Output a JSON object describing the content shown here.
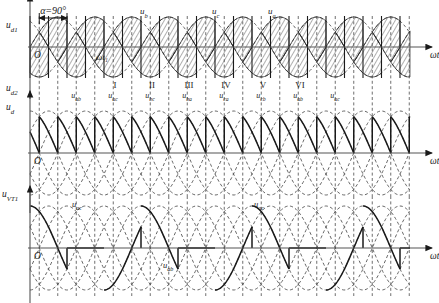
{
  "figure": {
    "title_annotation": "α=90°",
    "background": "#ffffff",
    "ink": "#1a1a1a",
    "dash_color": "#4a4a4a",
    "axis_color": "#555555",
    "width": 439,
    "height": 303
  },
  "axes": [
    {
      "id": "upper",
      "y_label_top": "uₑ₁",
      "y_label_top_plain": "ud1",
      "y_label_bottom": "ud2",
      "origin_label": "O",
      "x_label": "ωt",
      "marker_label": "ωt₁"
    },
    {
      "id": "middle",
      "y_label": "ud",
      "origin_label": "O",
      "x_label": "ωt"
    },
    {
      "id": "lower",
      "y_label": "uVT1",
      "origin_label": "O",
      "x_label": "ωt"
    }
  ],
  "phase_labels": [
    {
      "text": "u",
      "sub": "b",
      "x": 140,
      "y": 14
    },
    {
      "text": "u",
      "sub": "c",
      "x": 212,
      "y": 14
    },
    {
      "text": "u",
      "sub": "a",
      "x": 268,
      "y": 14
    }
  ],
  "interval_labels": [
    {
      "roman": "I",
      "line": "u",
      "sub": "ac",
      "cx": 115
    },
    {
      "roman": "II",
      "line": "u",
      "sub": "bc",
      "cx": 152
    },
    {
      "roman": "III",
      "line": "u",
      "sub": "ba",
      "cx": 189
    },
    {
      "roman": "IV",
      "line": "u",
      "sub": "ca",
      "cx": 226
    },
    {
      "roman": "V",
      "line": "u",
      "sub": "cb",
      "cx": 263
    },
    {
      "roman": "VI",
      "line": "u",
      "sub": "ab",
      "cx": 300
    },
    {
      "roman": "",
      "line": "u",
      "sub": "ac",
      "cx": 337
    }
  ],
  "line_voltage_labels_middle": [
    {
      "text": "u",
      "sub": "ab",
      "x": 76,
      "y": 98
    },
    {
      "text": "u",
      "sub": "ac",
      "x": 113,
      "y": 98
    },
    {
      "text": "u",
      "sub": "bc",
      "x": 150,
      "y": 98
    },
    {
      "text": "u",
      "sub": "ba",
      "x": 187,
      "y": 98
    },
    {
      "text": "u",
      "sub": "ca",
      "x": 224,
      "y": 98
    },
    {
      "text": "u",
      "sub": "cb",
      "x": 261,
      "y": 98
    },
    {
      "text": "u",
      "sub": "ab",
      "x": 298,
      "y": 98
    },
    {
      "text": "u",
      "sub": "ac",
      "x": 335,
      "y": 98
    }
  ],
  "thyristor_labels": [
    {
      "text": "u",
      "sub": "ac",
      "x": 72,
      "y": 207
    },
    {
      "text": "u",
      "sub": "ab",
      "x": 163,
      "y": 268
    },
    {
      "text": "u",
      "sub": "ac",
      "x": 254,
      "y": 207
    }
  ],
  "chart_data": {
    "type": "line",
    "xlabel": "ωt",
    "grid": false,
    "legend": "none",
    "firing_angle_deg": 90,
    "period_px": 111,
    "plot_left": 30,
    "plot_right": 410,
    "panels": [
      {
        "name": "upper",
        "ylabel_top": "ud1",
        "ylabel_bottom": "ud2",
        "baseline_y": 47,
        "amplitude": 30,
        "series": [
          {
            "name": "ua",
            "phase_deg": 0,
            "style": "dashed"
          },
          {
            "name": "ub",
            "phase_deg": -120,
            "style": "dashed"
          },
          {
            "name": "uc",
            "phase_deg": -240,
            "style": "dashed"
          }
        ],
        "hatched_regions": true
      },
      {
        "name": "middle",
        "ylabel": "ud",
        "baseline_y": 153,
        "amplitude": 42,
        "series": [
          {
            "name": "uab",
            "phase_deg": 30,
            "style": "dashed"
          },
          {
            "name": "uac",
            "phase_deg": -30,
            "style": "dashed"
          },
          {
            "name": "ubc",
            "phase_deg": -90,
            "style": "dashed"
          },
          {
            "name": "uba",
            "phase_deg": -150,
            "style": "dashed"
          },
          {
            "name": "uca",
            "phase_deg": -210,
            "style": "dashed"
          },
          {
            "name": "ucb",
            "phase_deg": -270,
            "style": "dashed"
          }
        ],
        "output_style": "sawtooth",
        "conduction_deg": 60
      },
      {
        "name": "lower",
        "ylabel": "uVT1",
        "baseline_y": 248,
        "amplitude": 42,
        "series": [
          {
            "name": "uab",
            "phase_deg": 30,
            "style": "dashed"
          },
          {
            "name": "uac",
            "phase_deg": -30,
            "style": "dashed"
          },
          {
            "name": "ubc",
            "phase_deg": -90,
            "style": "dashed"
          },
          {
            "name": "uba",
            "phase_deg": -150,
            "style": "dashed"
          },
          {
            "name": "uca",
            "phase_deg": -210,
            "style": "dashed"
          },
          {
            "name": "ucb",
            "phase_deg": -270,
            "style": "dashed"
          }
        ],
        "output_style": "thyristor-voltage"
      }
    ]
  }
}
